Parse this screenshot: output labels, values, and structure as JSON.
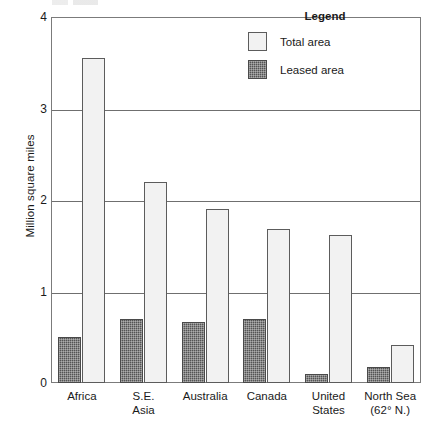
{
  "chart_data": {
    "type": "bar",
    "title": "",
    "xlabel": "",
    "ylabel": "Million square miles",
    "ylim": [
      0,
      4
    ],
    "yticks": [
      "0",
      "1",
      "2",
      "3",
      "4"
    ],
    "grid": true,
    "legend_position": "inside-top-right",
    "legend_title": "Legend",
    "categories": [
      "Africa",
      "S.E. Asia",
      "Australia",
      "Canada",
      "United States",
      "North Sea (62° N.)"
    ],
    "category_lines": [
      [
        "Africa",
        ""
      ],
      [
        "S.E.",
        "Asia"
      ],
      [
        "Australia",
        ""
      ],
      [
        "Canada",
        ""
      ],
      [
        "United",
        "States"
      ],
      [
        "North Sea",
        "(62° N.)"
      ]
    ],
    "series": [
      {
        "name": "Leased area",
        "pattern": "dark-solid",
        "color": "#545454",
        "values": [
          0.5,
          0.7,
          0.67,
          0.7,
          0.1,
          0.18
        ]
      },
      {
        "name": "Total area",
        "pattern": "light-dotted",
        "color": "#f2f2f2",
        "values": [
          3.55,
          2.2,
          1.9,
          1.68,
          1.62,
          0.42
        ]
      }
    ]
  },
  "legend": {
    "title": "Legend",
    "items": [
      {
        "label": "Total area",
        "swatch": "light-dotted"
      },
      {
        "label": "Leased area",
        "swatch": "dark-solid"
      }
    ]
  },
  "axes": {
    "y_title": "Million square miles",
    "y_ticks": [
      "0",
      "1",
      "2",
      "3",
      "4"
    ]
  }
}
